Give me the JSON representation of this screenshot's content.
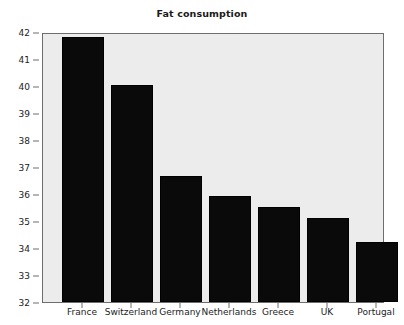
{
  "chart_data": {
    "type": "bar",
    "title": "Fat consumption",
    "xlabel": "",
    "ylabel": "",
    "categories": [
      "France",
      "Switzerland",
      "Germany",
      "Netherlands",
      "Greece",
      "UK",
      "Portugal"
    ],
    "values": [
      41.8,
      40.05,
      36.65,
      35.92,
      35.53,
      35.13,
      34.22
    ],
    "ylim": [
      32,
      42
    ],
    "yticks": [
      32,
      33,
      34,
      35,
      36,
      37,
      38,
      39,
      40,
      41,
      42
    ],
    "ytick_labels": [
      "32",
      "33",
      "34",
      "35",
      "36",
      "37",
      "38",
      "39",
      "40",
      "41",
      "42"
    ],
    "grid": false,
    "legend": false,
    "bar_color": "#0a0a0a",
    "plot_background": "#ececec",
    "figure_background": "#ffffff",
    "axis_color": "#6e6e6e"
  }
}
